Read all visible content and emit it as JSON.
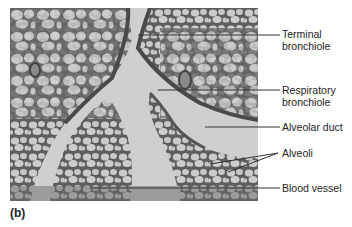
{
  "figure": {
    "panel_label": "(b)",
    "image_description": "Light micrograph of lung tissue showing alveolar structures",
    "labels": [
      {
        "id": "terminal-bronchiole",
        "line1": "Terminal",
        "line2": "bronchiole"
      },
      {
        "id": "respiratory-bronchiole",
        "line1": "Respiratory",
        "line2": "bronchiole"
      },
      {
        "id": "alveolar-duct",
        "line1": "Alveolar duct",
        "line2": ""
      },
      {
        "id": "alveoli",
        "line1": "Alveoli",
        "line2": ""
      },
      {
        "id": "blood-vessel",
        "line1": "Blood vessel",
        "line2": ""
      }
    ]
  }
}
